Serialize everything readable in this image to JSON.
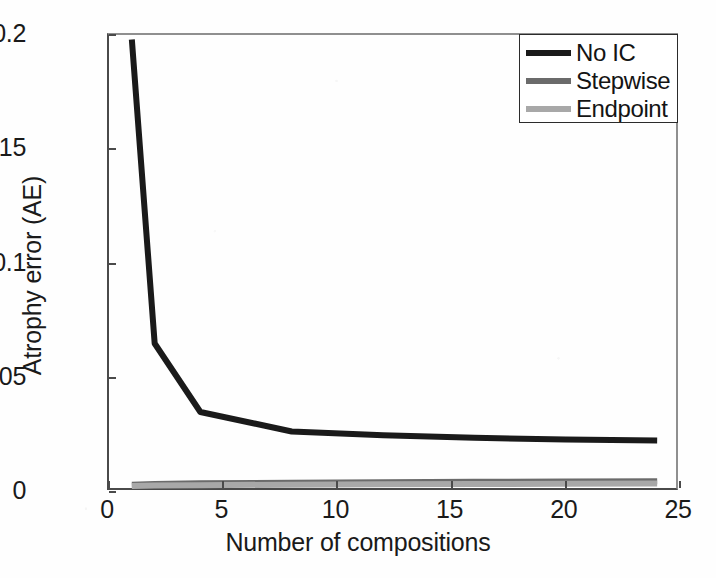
{
  "figure": {
    "background_color": "#ffffff",
    "axis_color": "#4a4a4a"
  },
  "axes": {
    "xlabel": "Number of compositions",
    "ylabel": "Atrophy error (AE)",
    "xticks": [
      "0",
      "5",
      "10",
      "15",
      "20",
      "25"
    ],
    "yticks": [
      "0",
      "0.05",
      "0.1",
      "0.15",
      "0.2"
    ]
  },
  "legend": {
    "entries": [
      {
        "label": "No IC",
        "color": "#1a1a1a",
        "width": 6
      },
      {
        "label": "Stepwise",
        "color": "#6b6b6b",
        "width": 6
      },
      {
        "label": "Endpoint",
        "color": "#a8a8a8",
        "width": 6
      }
    ]
  },
  "caption_ghost": "",
  "chart_data": {
    "type": "line",
    "title": "",
    "xlabel": "Number of compositions",
    "ylabel": "Atrophy error (AE)",
    "xlim": [
      0,
      25
    ],
    "ylim": [
      0,
      0.2
    ],
    "xticks": [
      0,
      5,
      10,
      15,
      20,
      25
    ],
    "yticks": [
      0,
      0.05,
      0.1,
      0.15,
      0.2
    ],
    "grid": false,
    "legend_position": "upper right",
    "x": [
      1,
      2,
      4,
      8,
      12,
      16,
      20,
      24
    ],
    "series": [
      {
        "name": "No IC",
        "color": "#1a1a1a",
        "linewidth": 6,
        "values": [
          0.198,
          0.065,
          0.035,
          0.0265,
          0.0248,
          0.0237,
          0.023,
          0.0225
        ]
      },
      {
        "name": "Stepwise",
        "color": "#6b6b6b",
        "linewidth": 6,
        "values": [
          0.0032,
          0.0035,
          0.0038,
          0.0041,
          0.0043,
          0.0045,
          0.0046,
          0.0047
        ]
      },
      {
        "name": "Endpoint",
        "color": "#a8a8a8",
        "linewidth": 6,
        "values": [
          0.0026,
          0.0028,
          0.003,
          0.0032,
          0.0034,
          0.0035,
          0.0036,
          0.0037
        ]
      }
    ]
  }
}
